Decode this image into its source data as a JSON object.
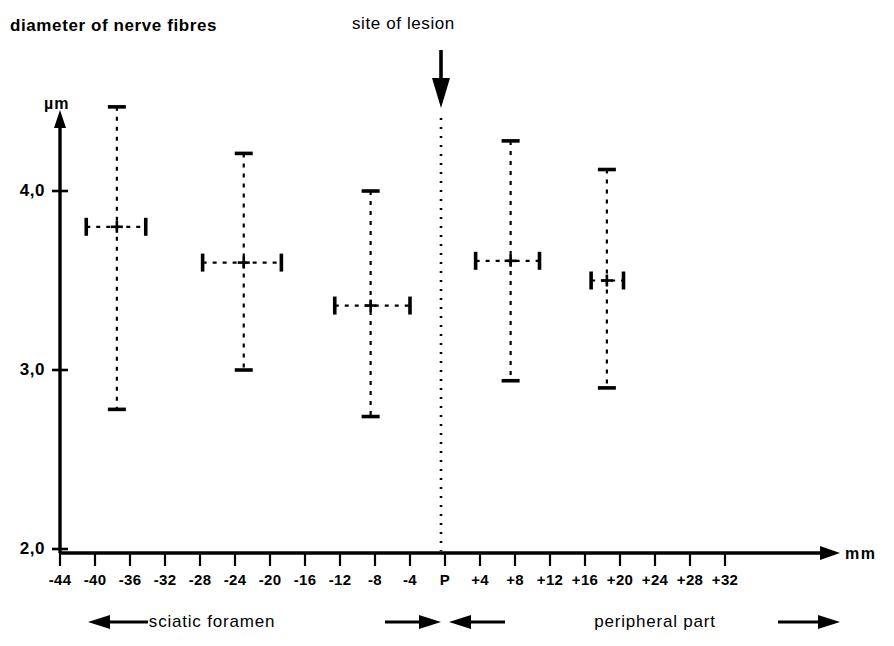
{
  "figure": {
    "title_left": "diameter of nerve fibres",
    "title_lesion": "site of lesion",
    "y_axis_unit": "µm",
    "x_axis_unit": "mm"
  },
  "legend": {
    "left_label": "sciatic foramen",
    "right_label": "peripheral part"
  },
  "chart_data": {
    "type": "scatter",
    "title": "diameter of nerve fibres",
    "subtitle": "site of lesion",
    "xlabel": "mm",
    "ylabel": "µm",
    "xlim": [
      -46,
      36
    ],
    "ylim": [
      2.0,
      4.55
    ],
    "grid": false,
    "legend_position": "below-axis",
    "x_tick_labels": [
      "-44",
      "-40",
      "-36",
      "-32",
      "-28",
      "-24",
      "-20",
      "-16",
      "-12",
      "-8",
      "-4",
      "P",
      "+4",
      "+8",
      "+12",
      "+16",
      "+20",
      "+24",
      "+28",
      "+32"
    ],
    "x_tick_values": [
      -44,
      -40,
      -36,
      -32,
      -28,
      -24,
      -20,
      -16,
      -12,
      -8,
      -4,
      0,
      4,
      8,
      12,
      16,
      20,
      24,
      28,
      32
    ],
    "y_tick_labels": [
      "4,0",
      "3,0",
      "2,0"
    ],
    "y_tick_values": [
      4.0,
      3.0,
      2.0
    ],
    "lesion_marker_x": 0,
    "series": [
      {
        "name": "mean diameter with SD",
        "points": [
          {
            "x": -37.5,
            "y": 3.8,
            "y_low": 2.78,
            "y_high": 4.47,
            "x_low": -41.0,
            "x_high": -34.2
          },
          {
            "x": -23.0,
            "y": 3.6,
            "y_low": 3.0,
            "y_high": 4.21,
            "x_low": -27.7,
            "x_high": -18.7
          },
          {
            "x": -8.5,
            "y": 3.36,
            "y_low": 2.74,
            "y_high": 4.0,
            "x_low": -12.6,
            "x_high": -4.0
          },
          {
            "x": 7.5,
            "y": 3.61,
            "y_low": 2.94,
            "y_high": 4.28,
            "x_low": 3.5,
            "x_high": 10.8
          },
          {
            "x": 18.5,
            "y": 3.5,
            "y_low": 2.9,
            "y_high": 4.12,
            "x_low": 16.7,
            "x_high": 20.4
          }
        ]
      }
    ]
  }
}
